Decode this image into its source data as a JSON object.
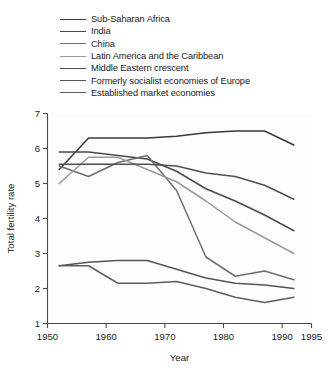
{
  "chart_data": {
    "type": "line",
    "title": "",
    "xlabel": "Year",
    "ylabel": "Total fertility rate",
    "xlim": [
      1950,
      1995
    ],
    "ylim": [
      1,
      7
    ],
    "xticks": [
      1950,
      1960,
      1970,
      1980,
      1990,
      1995
    ],
    "yticks": [
      1,
      2,
      3,
      4,
      5,
      6,
      7
    ],
    "grid": false,
    "legend_position": "top",
    "x": [
      1952,
      1957,
      1962,
      1967,
      1972,
      1977,
      1982,
      1987,
      1992
    ],
    "series": [
      {
        "name": "Sub-Saharan Africa",
        "color": "#3a3a3a",
        "values": [
          5.4,
          6.3,
          6.3,
          6.3,
          6.35,
          6.45,
          6.5,
          6.5,
          6.1
        ]
      },
      {
        "name": "India",
        "color": "#4a4a4a",
        "values": [
          5.9,
          5.9,
          5.8,
          5.7,
          5.35,
          4.85,
          4.5,
          4.1,
          3.65
        ]
      },
      {
        "name": "China",
        "color": "#6e6e6e",
        "values": [
          5.5,
          5.2,
          5.6,
          5.8,
          4.8,
          2.9,
          2.35,
          2.5,
          2.25
        ]
      },
      {
        "name": "Latin America and the Caribbean",
        "color": "#9a9a9a",
        "values": [
          5.0,
          5.75,
          5.75,
          5.4,
          5.05,
          4.5,
          3.9,
          3.45,
          3.0
        ]
      },
      {
        "name": "Middle Eastern crescent",
        "color": "#4f4f4f",
        "values": [
          5.55,
          5.55,
          5.55,
          5.55,
          5.5,
          5.3,
          5.2,
          4.95,
          4.55
        ]
      },
      {
        "name": "Formerly socialist economies of Europe",
        "color": "#555555",
        "values": [
          2.65,
          2.75,
          2.8,
          2.8,
          2.55,
          2.3,
          2.15,
          2.1,
          2.0
        ]
      },
      {
        "name": "Established market economies",
        "color": "#5e5e5e",
        "values": [
          2.65,
          2.65,
          2.15,
          2.15,
          2.2,
          2.0,
          1.75,
          1.6,
          1.75
        ]
      }
    ]
  },
  "legend": {
    "items": [
      {
        "label": "Sub-Saharan Africa",
        "color": "#3a3a3a"
      },
      {
        "label": "India",
        "color": "#4a4a4a"
      },
      {
        "label": "China",
        "color": "#6e6e6e"
      },
      {
        "label": "Latin America and the Caribbean",
        "color": "#9a9a9a"
      },
      {
        "label": "Middle Eastern crescent",
        "color": "#4f4f4f"
      },
      {
        "label": "Formerly socialist economies of Europe",
        "color": "#555555"
      },
      {
        "label": "Established market economies",
        "color": "#5e5e5e"
      }
    ]
  },
  "axes": {
    "x_title": "Year",
    "y_title": "Total fertility rate",
    "x_tick_labels": [
      "1950",
      "1960",
      "1970",
      "1980",
      "1990",
      "1995"
    ],
    "y_tick_labels": [
      "1",
      "2",
      "3",
      "4",
      "5",
      "6",
      "7"
    ]
  }
}
